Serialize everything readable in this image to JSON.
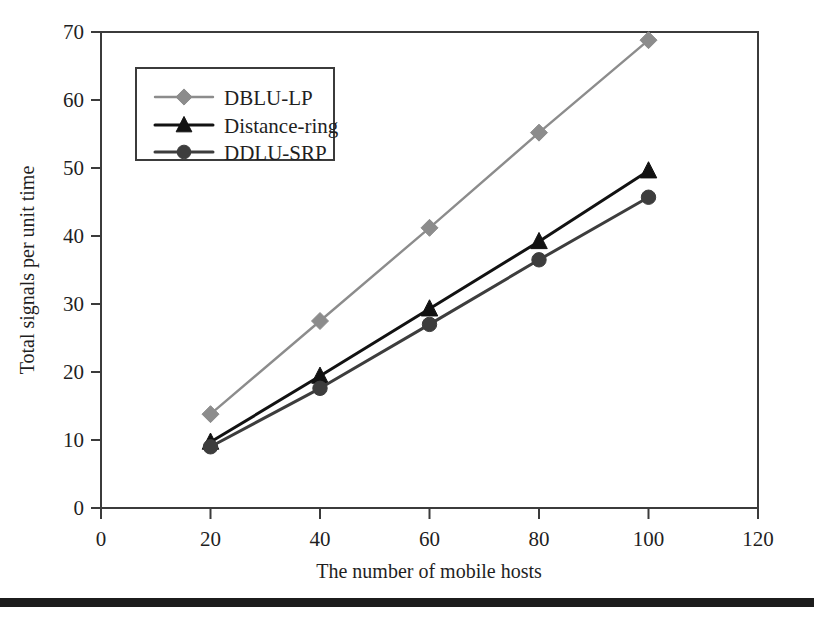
{
  "chart_data": {
    "type": "line",
    "title": "",
    "subtitle": "",
    "xlabel": "The number of mobile hosts",
    "ylabel": "Total signals per unit time",
    "x": [
      20,
      40,
      60,
      80,
      100
    ],
    "xlim": [
      0,
      120
    ],
    "ylim": [
      0,
      70
    ],
    "xticks": [
      0,
      20,
      40,
      60,
      80,
      100,
      120
    ],
    "yticks": [
      0,
      10,
      20,
      30,
      40,
      50,
      60,
      70
    ],
    "xtick_labels": [
      "0",
      "20",
      "40",
      "60",
      "80",
      "100",
      "120"
    ],
    "ytick_labels": [
      "0",
      "10",
      "20",
      "30",
      "40",
      "50",
      "60",
      "70"
    ],
    "grid": false,
    "legend_position": "upper-left-inside",
    "series": [
      {
        "name": "DBLU-LP",
        "marker": "diamond",
        "color": "#8c8c8c",
        "values": [
          13.8,
          27.5,
          41.2,
          55.2,
          68.8
        ]
      },
      {
        "name": "Distance-ring",
        "marker": "triangle",
        "color": "#121212",
        "values": [
          9.7,
          19.4,
          29.3,
          39.2,
          49.6
        ]
      },
      {
        "name": "DDLU-SRP",
        "marker": "circle",
        "color": "#3d3d3d",
        "values": [
          9.0,
          17.6,
          27.0,
          36.5,
          45.7
        ]
      }
    ]
  },
  "legend": {
    "entries": [
      "DBLU-LP",
      "Distance-ring",
      "DDLU-SRP"
    ]
  },
  "colors": {
    "axis": "#3b3b3b",
    "text": "#1f1f1f",
    "background": "#ffffff",
    "footer_rule": "#1c1c1c",
    "series_dblu_lp": "#8c8c8c",
    "series_distance_ring": "#121212",
    "series_ddlu_srp": "#3d3d3d"
  },
  "footer": {
    "rule_visible": "true"
  }
}
